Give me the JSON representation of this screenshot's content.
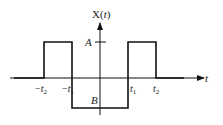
{
  "diagram": {
    "type": "piecewise-signal-plot",
    "y_axis_label": "X(t)",
    "y_axis_label_func": "X",
    "y_axis_label_open": "(",
    "y_axis_label_var": "t",
    "y_axis_label_close": ")",
    "x_axis_label": "t",
    "level_labels": {
      "high": "A",
      "low": "B"
    },
    "x_ticks": [
      {
        "sign": "−",
        "base": "t",
        "sub": "2"
      },
      {
        "sign": "−",
        "base": "t",
        "sub": "1"
      },
      {
        "sign": "",
        "base": "t",
        "sub": "1"
      },
      {
        "sign": "",
        "base": "t",
        "sub": "2"
      }
    ],
    "segments": [
      {
        "from": "-inf",
        "to": "-t2",
        "value": "0"
      },
      {
        "from": "-t2",
        "to": "-t1",
        "value": "A"
      },
      {
        "from": "-t1",
        "to": "t1",
        "value": "B"
      },
      {
        "from": "t1",
        "to": "t2",
        "value": "A"
      },
      {
        "from": "t2",
        "to": "inf",
        "value": "0"
      }
    ],
    "colors": {
      "line": "#111111",
      "background": "#ffffff"
    }
  }
}
